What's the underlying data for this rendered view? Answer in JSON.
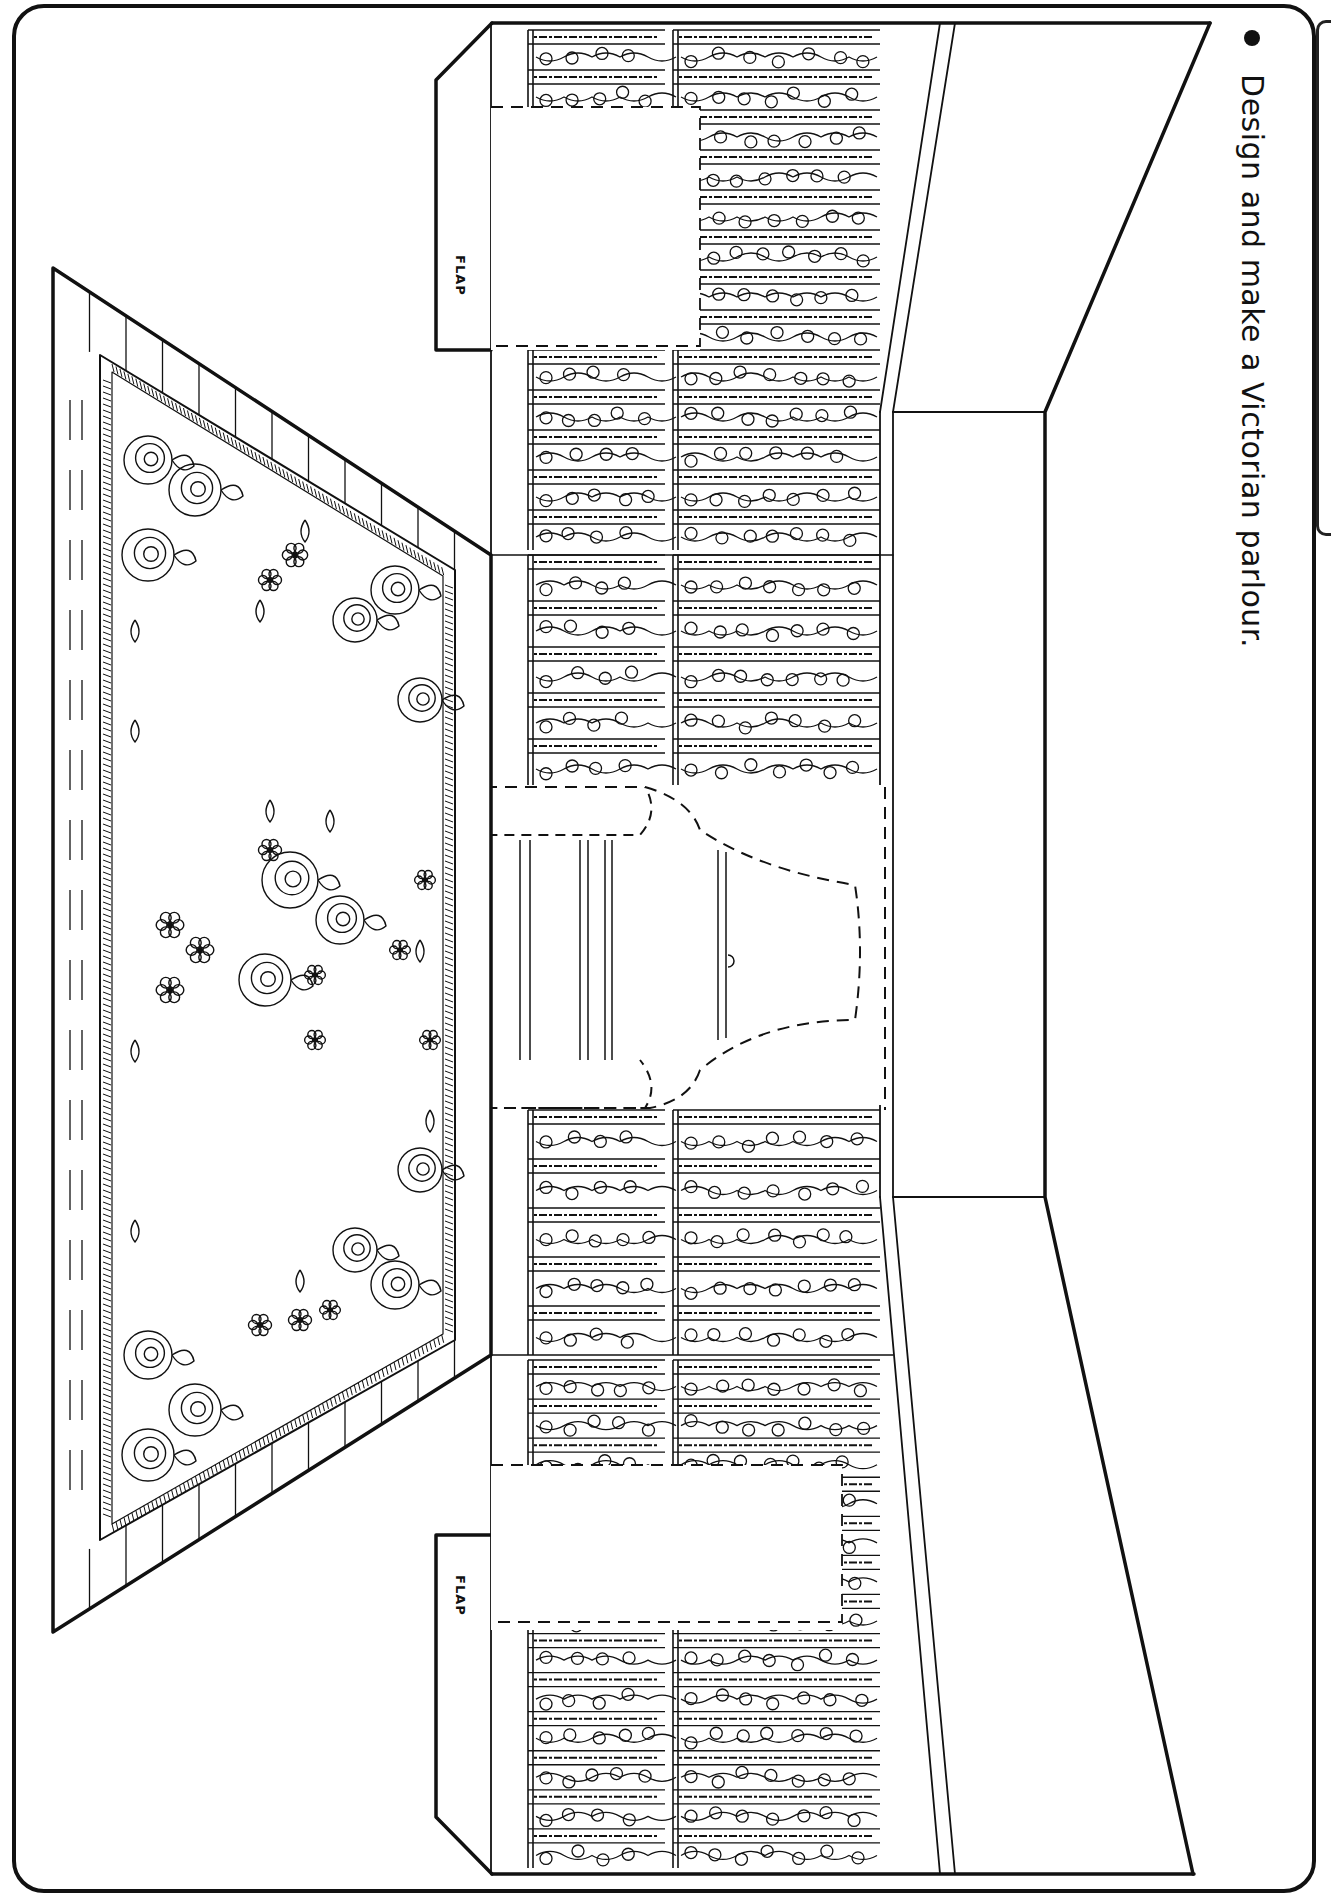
{
  "worksheet": {
    "instruction_bullet": "bullet-icon",
    "instruction_text": "Design and make a Victorian parlour.",
    "flaps": [
      {
        "label": "FLAP",
        "position": "top"
      },
      {
        "label": "FLAP",
        "position": "bottom"
      }
    ],
    "colors": {
      "ink": "#111111",
      "paper": "#ffffff"
    }
  },
  "scene": {
    "title": "Victorian parlour room template",
    "parts": [
      "back-wall",
      "left-wall",
      "right-wall",
      "floor-rug",
      "window",
      "ceiling-panel",
      "floor-panel"
    ],
    "wallpaper": {
      "pattern": "floral-vine-stripes",
      "upper_stripe_count": 13,
      "lower_stripe_count": 13
    },
    "rug": {
      "pattern": "roses",
      "fringe": true
    },
    "window": {
      "curtains": "dashed-cut-outline",
      "tie_backs": 2
    },
    "cutouts": [
      {
        "name": "door-cutout-top",
        "outline": "dashed"
      },
      {
        "name": "door-cutout-bottom",
        "outline": "dashed"
      }
    ]
  }
}
